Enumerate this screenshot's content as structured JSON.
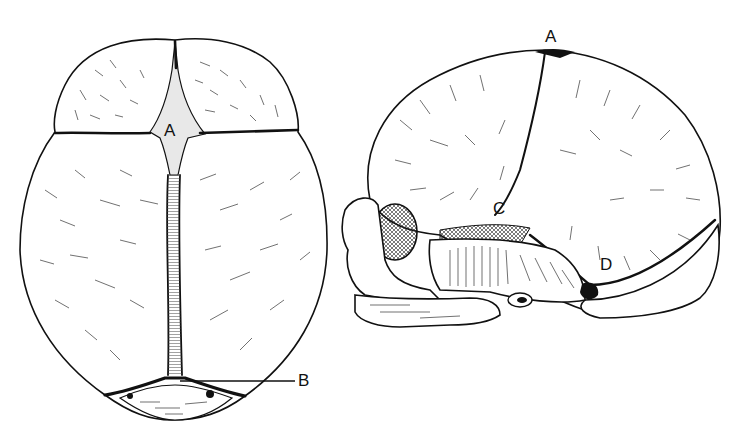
{
  "figure": {
    "views": [
      {
        "id": "superior",
        "name": "Skull viewed from above"
      },
      {
        "id": "lateral",
        "name": "Skull viewed from the side"
      }
    ],
    "labels": {
      "superior_A": "A",
      "superior_B": "B",
      "lateral_A": "A",
      "lateral_C": "C",
      "lateral_D": "D"
    },
    "colors": {
      "ink": "#111111",
      "paper": "#ffffff"
    }
  }
}
